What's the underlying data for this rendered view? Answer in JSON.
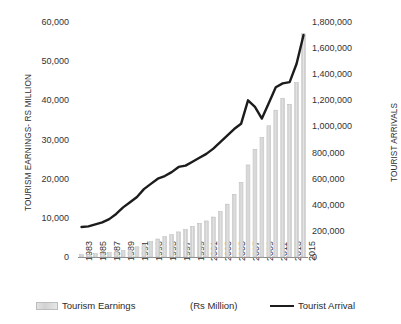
{
  "chart_data": {
    "type": "bar",
    "title": "",
    "subtitle": "",
    "xlabel": "",
    "ylabel": "TOURISM EARNINGS- RS MILLION",
    "y2label": "TOURIST ARRIVALS",
    "grid": false,
    "legend_position": "bottom",
    "legend_note": "(Rs Million)",
    "ylim": [
      0,
      60000
    ],
    "y2lim": [
      0,
      1800000
    ],
    "yticks": [
      "0",
      "10,000",
      "20,000",
      "30,000",
      "40,000",
      "50,000",
      "60,000"
    ],
    "ytick_values": [
      0,
      10000,
      20000,
      30000,
      40000,
      50000,
      60000
    ],
    "y2ticks": [
      "0",
      "200,000",
      "400,000",
      "600,000",
      "800,000",
      "1,000,000",
      "1,200,000",
      "1,400,000",
      "1,600,000",
      "1,800,000"
    ],
    "y2tick_values": [
      0,
      200000,
      400000,
      600000,
      800000,
      1000000,
      1200000,
      1400000,
      1600000,
      1800000
    ],
    "categories": [
      "1983",
      "1984",
      "1985",
      "1986",
      "1987",
      "1988",
      "1989",
      "1990",
      "1991",
      "1992",
      "1993",
      "1994",
      "1995",
      "1996",
      "1997",
      "1998",
      "1999",
      "2000",
      "2001",
      "2002",
      "2003",
      "2004",
      "2005",
      "2006",
      "2007",
      "2008",
      "2009",
      "2010",
      "2011",
      "2012",
      "2013",
      "2014",
      "2015"
    ],
    "xtick_labels": [
      "1983",
      "1985",
      "1987",
      "1989",
      "1991",
      "1993",
      "1995",
      "1997",
      "1999",
      "2001",
      "2003",
      "2005",
      "2007",
      "2009",
      "2011",
      "2013",
      "2015"
    ],
    "series": [
      {
        "name": "Tourism Earnings",
        "type": "bar",
        "axis": "left",
        "unit": "Rs Million",
        "color": "#d9d9d9",
        "edge_color": "#b5b5b5",
        "values": [
          600,
          700,
          850,
          950,
          1100,
          1300,
          1600,
          1900,
          2600,
          3200,
          3900,
          4600,
          5200,
          5700,
          6400,
          7000,
          7800,
          8600,
          9200,
          10200,
          11600,
          13500,
          16000,
          19000,
          23500,
          27500,
          30500,
          33500,
          37500,
          40500,
          39000,
          44500,
          57000
        ]
      },
      {
        "name": "Tourist Arrival",
        "type": "line",
        "axis": "right",
        "unit": "arrivals",
        "color": "#1c1c1c",
        "values": [
          230000,
          235000,
          250000,
          265000,
          290000,
          330000,
          380000,
          420000,
          460000,
          520000,
          560000,
          600000,
          620000,
          650000,
          690000,
          700000,
          730000,
          760000,
          790000,
          830000,
          880000,
          930000,
          980000,
          1020000,
          1200000,
          1150000,
          1060000,
          1180000,
          1300000,
          1330000,
          1340000,
          1480000,
          1700000
        ]
      }
    ]
  }
}
